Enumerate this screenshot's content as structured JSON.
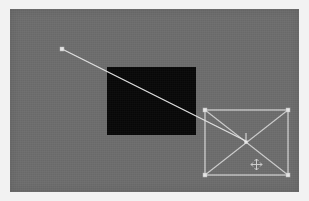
{
  "app": {
    "title": "Vector Canvas",
    "canvas_background_color": "#6d6d6d",
    "frame_background_color": "#f2f2f2"
  },
  "canvas": {
    "label": "drawing-canvas",
    "x": 10,
    "y": 9,
    "width": 289,
    "height": 183,
    "unit": "px"
  },
  "shapes": [
    {
      "id": "rect-filled",
      "name": "Filled Rectangle",
      "type": "rectangle",
      "fill": "#080808",
      "stroke": "none",
      "x": 97,
      "y": 58,
      "width": 89,
      "height": 68,
      "selected": false
    },
    {
      "id": "line-1",
      "name": "Line",
      "type": "line",
      "stroke": "#e3e3e3",
      "x1": 52,
      "y1": 40,
      "x2": 236,
      "y2": 132,
      "selected": false
    },
    {
      "id": "rect-selected",
      "name": "Selected Rectangle",
      "type": "rectangle",
      "fill": "none",
      "stroke": "#d9d9d9",
      "x": 195,
      "y": 101,
      "width": 83,
      "height": 65,
      "selected": true
    }
  ],
  "selection": {
    "label": "selection-box",
    "handle_color": "#e8e8e8",
    "edge_color": "#d9d9d9",
    "diagonal_color": "#cfcfcf",
    "handle_size": 4,
    "handles": [
      {
        "name": "handle-top-left",
        "x": 195,
        "y": 101
      },
      {
        "name": "handle-top-right",
        "x": 278,
        "y": 101
      },
      {
        "name": "handle-bottom-left",
        "x": 195,
        "y": 166
      },
      {
        "name": "handle-bottom-right",
        "x": 278,
        "y": 166
      }
    ],
    "center": {
      "name": "selection-center",
      "x": 236,
      "y": 133
    },
    "diagonals_visible": true
  },
  "line_handles": [
    {
      "name": "line-start-handle",
      "x": 52,
      "y": 40
    },
    {
      "name": "line-end-handle",
      "x": 236,
      "y": 132
    }
  ],
  "cursor": {
    "name": "move-cursor",
    "glyph": "move",
    "x": 240,
    "y": 149,
    "color": "#e2e2e2"
  },
  "status": {
    "tool": "move",
    "selection_count": "1"
  }
}
